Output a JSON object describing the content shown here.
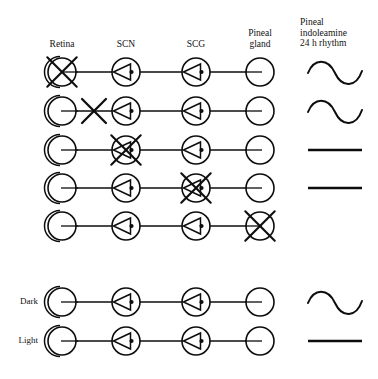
{
  "figure": {
    "title_present": false,
    "column_headers": [
      {
        "id": "retina",
        "label": "Retina",
        "x": 62,
        "y": 44
      },
      {
        "id": "scn",
        "label": "SCN",
        "x": 126,
        "y": 44
      },
      {
        "id": "scg",
        "label": "SCG",
        "x": 196,
        "y": 44
      },
      {
        "id": "pineal-gland",
        "label": "Pineal\ngland",
        "x": 260,
        "y": 33
      },
      {
        "id": "rhythm",
        "label": "Pineal\nindoleamine\n24 h rhythm",
        "x": 335,
        "y": 22
      }
    ],
    "columns_x": {
      "retina": 62,
      "scn": 126,
      "scg": 196,
      "pineal": 260,
      "rhythm": 335
    },
    "node_radius": 14,
    "rows": [
      {
        "index": 1,
        "label": "",
        "y": 72,
        "retina": {
          "state": "crossed"
        },
        "link_retina_scn": {
          "state": "intact"
        },
        "scn": {
          "state": "intact"
        },
        "link_scn_scg": {
          "state": "intact"
        },
        "scg": {
          "state": "intact"
        },
        "link_scg_pineal": {
          "state": "intact"
        },
        "pineal": {
          "state": "intact"
        },
        "rhythm": "sine"
      },
      {
        "index": 2,
        "label": "",
        "y": 111,
        "retina": {
          "state": "intact"
        },
        "link_retina_scn": {
          "state": "crossed"
        },
        "scn": {
          "state": "intact"
        },
        "link_scn_scg": {
          "state": "intact"
        },
        "scg": {
          "state": "intact"
        },
        "link_scg_pineal": {
          "state": "intact"
        },
        "pineal": {
          "state": "intact"
        },
        "rhythm": "sine"
      },
      {
        "index": 3,
        "label": "",
        "y": 150,
        "retina": {
          "state": "intact"
        },
        "link_retina_scn": {
          "state": "intact"
        },
        "scn": {
          "state": "crossed"
        },
        "link_scn_scg": {
          "state": "intact"
        },
        "scg": {
          "state": "intact"
        },
        "link_scg_pineal": {
          "state": "intact"
        },
        "pineal": {
          "state": "intact"
        },
        "rhythm": "flat"
      },
      {
        "index": 4,
        "label": "",
        "y": 188,
        "retina": {
          "state": "intact"
        },
        "link_retina_scn": {
          "state": "intact"
        },
        "scn": {
          "state": "intact"
        },
        "link_scn_scg": {
          "state": "intact"
        },
        "scg": {
          "state": "crossed"
        },
        "link_scg_pineal": {
          "state": "intact"
        },
        "pineal": {
          "state": "intact"
        },
        "rhythm": "flat"
      },
      {
        "index": 5,
        "label": "",
        "y": 226,
        "retina": {
          "state": "intact"
        },
        "link_retina_scn": {
          "state": "intact"
        },
        "scn": {
          "state": "intact"
        },
        "link_scn_scg": {
          "state": "intact"
        },
        "scg": {
          "state": "intact"
        },
        "link_scg_pineal": {
          "state": "intact"
        },
        "pineal": {
          "state": "crossed"
        },
        "rhythm": "none"
      },
      {
        "index": 6,
        "label": "Dark",
        "y": 302,
        "retina": {
          "state": "intact"
        },
        "link_retina_scn": {
          "state": "intact"
        },
        "scn": {
          "state": "intact"
        },
        "link_scn_scg": {
          "state": "intact"
        },
        "scg": {
          "state": "intact"
        },
        "link_scg_pineal": {
          "state": "intact"
        },
        "pineal": {
          "state": "intact"
        },
        "rhythm": "sine"
      },
      {
        "index": 7,
        "label": "Light",
        "y": 341,
        "retina": {
          "state": "intact"
        },
        "link_retina_scn": {
          "state": "intact"
        },
        "scn": {
          "state": "intact"
        },
        "link_scn_scg": {
          "state": "intact"
        },
        "scg": {
          "state": "intact"
        },
        "link_scg_pineal": {
          "state": "intact"
        },
        "pineal": {
          "state": "intact"
        },
        "rhythm": "flat"
      }
    ],
    "row_labels": [
      {
        "row": 6,
        "label": "Dark"
      },
      {
        "row": 7,
        "label": "Light"
      }
    ],
    "colors": {
      "ink": "#0d0d0d",
      "background": "#ffffff"
    },
    "legend_notes": {
      "retina_symbol": "eye-circle-with-crescent",
      "ganglion_symbol": "circle-with-left-triangle-and-dot",
      "pineal_symbol": "plain-circle",
      "crossed_symbol": "X-overlay-denotes-lesion",
      "rhythm_sine": "sinusoidal 24 h rhythm present",
      "rhythm_flat": "flat line, rhythm abolished",
      "rhythm_none": "no trace shown"
    }
  }
}
